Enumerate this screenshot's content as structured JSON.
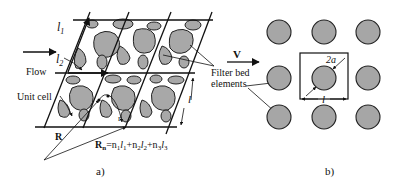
{
  "figure": {
    "panel_a": {
      "caption": "a)",
      "labels": {
        "l1": "l",
        "l1_sub": "1",
        "l2": "l",
        "l2_sub": "2",
        "flow": "Flow",
        "unit_cell": "Unit cell",
        "R": "R",
        "r": "r",
        "l": "l",
        "Rn_formula": "R",
        "Rn_sub": "n",
        "Rn_rhs": "=n",
        "n1": "1",
        "l_1": "l",
        "l_1_sub": "1",
        "plus_n2": "+n",
        "n2": "2",
        "l_2": "l",
        "l_2_sub": "2",
        "plus_n3": "+n",
        "n3": "3",
        "l_3": "l",
        "l_3_sub": "3"
      }
    },
    "shared": {
      "filter_bed_line1": "Filter bed",
      "filter_bed_line2": "elements"
    },
    "panel_b": {
      "caption": "b)",
      "labels": {
        "V": "V",
        "two_a": "2a",
        "l": "l"
      }
    },
    "colors": {
      "grain_fill": "#a8a8a8",
      "stroke": "#111111",
      "background": "#ffffff"
    }
  }
}
